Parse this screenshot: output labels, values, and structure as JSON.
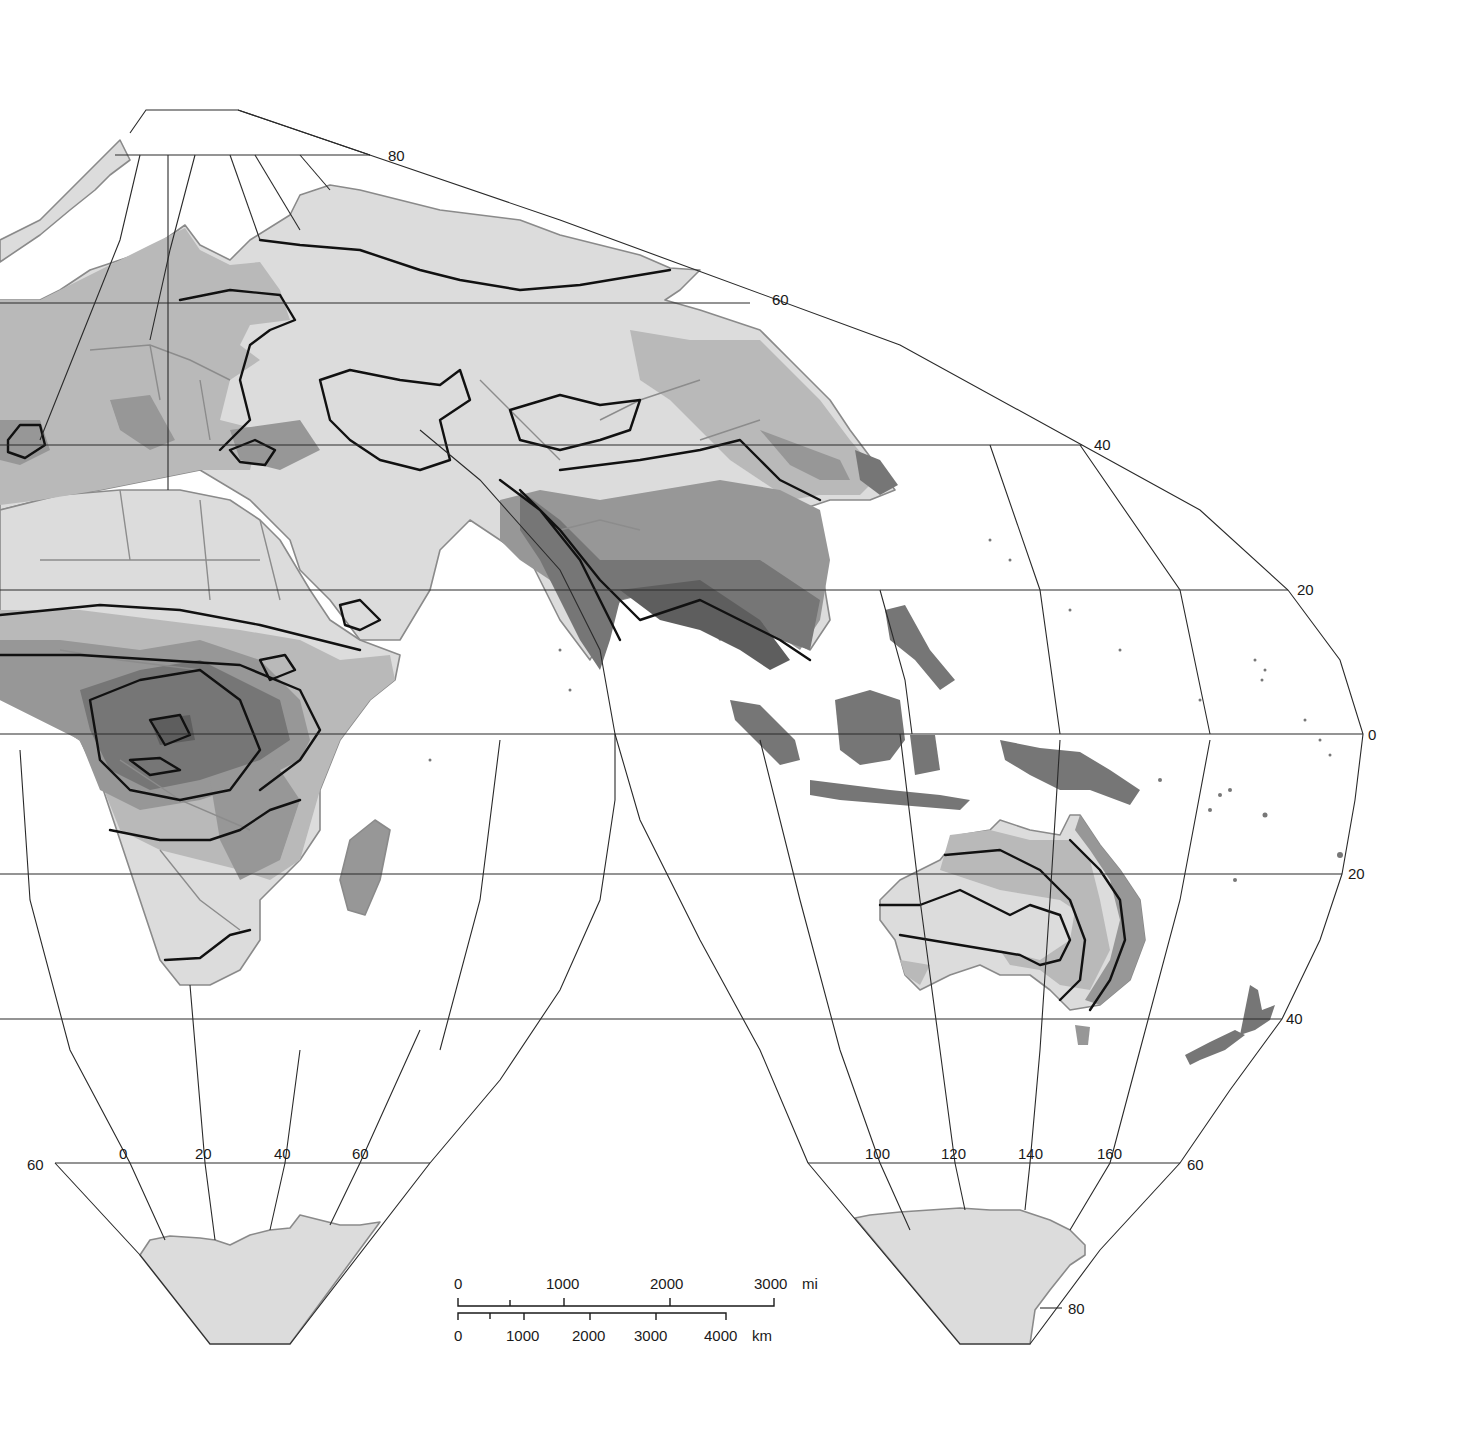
{
  "map": {
    "type": "interrupted-projection world map (Eastern Hemisphere lobes)",
    "legend_colors": {
      "zone_lightest": "#dcdcdc",
      "zone_light": "#b9b9b9",
      "zone_medium": "#979797",
      "zone_dark": "#767676",
      "zone_darkest": "#5e5e5e",
      "isoline": "#111111",
      "coastline": "#8a8a8a",
      "graticule": "#2a2a2a"
    },
    "regions_shown": [
      "Europe",
      "Africa",
      "Asia",
      "Australia",
      "Indonesia",
      "New Zealand",
      "Antarctica"
    ]
  },
  "latitude_labels": {
    "n80": "80",
    "n60": "60",
    "n40": "40",
    "n20": "20",
    "eq": "0",
    "s20": "20",
    "s40": "40",
    "s60_left": "60",
    "s60_right": "60",
    "s80": "80"
  },
  "longitude_labels": {
    "left_lobe": [
      "0",
      "20",
      "40",
      "60"
    ],
    "right_lobe": [
      "100",
      "120",
      "140",
      "160"
    ]
  },
  "scale_bar": {
    "miles": {
      "ticks": [
        "0",
        "1000",
        "2000",
        "3000"
      ],
      "unit": "mi"
    },
    "km": {
      "ticks": [
        "0",
        "1000",
        "2000",
        "3000",
        "4000"
      ],
      "unit": "km"
    }
  }
}
